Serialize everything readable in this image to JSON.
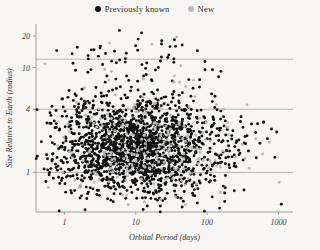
{
  "legend": {
    "items": [
      {
        "label": "Previously known",
        "color": "#111111",
        "icon": "filled-circle-icon"
      },
      {
        "label": "New",
        "color": "#b9b9b9",
        "icon": "filled-circle-icon"
      }
    ]
  },
  "chart_data": {
    "type": "scatter",
    "title": "",
    "xlabel": "Orbital Period (days)",
    "ylabel": "Size Relative to Earth (radius)",
    "xscale": "log",
    "yscale": "log",
    "xlim": [
      0.4,
      1600
    ],
    "ylim": [
      0.42,
      26
    ],
    "xticks": [
      1,
      10,
      100,
      1000
    ],
    "xticklabels": [
      "1",
      "10",
      "100",
      "1000"
    ],
    "yticks": [
      1,
      4,
      10,
      20
    ],
    "yticklabels": [
      "1",
      "4",
      "10",
      "20"
    ],
    "grid": "horizontal",
    "gridlines_y": [
      1,
      4,
      12
    ],
    "legend_position": "top-center",
    "background": "#f7f6f3",
    "series": [
      {
        "name": "Previously known",
        "color": "#111111",
        "marker": "circle",
        "marker_size": 2.0,
        "count": 1750,
        "density_note": "log-normal cloud centered near period 12 d, radius 1.6 Earth radii; heavy concentration between 0.9 and 3 Earth radii across 2-200 days"
      },
      {
        "name": "New",
        "color": "#b9b9b9",
        "marker": "circle",
        "marker_size": 2.0,
        "count": 250,
        "density_note": "sparser, similar cloud, proportionally more points at longer orbital periods (100-800 days) and smaller radii"
      }
    ],
    "points_known": [
      [
        0.52,
        1.08
      ],
      [
        0.55,
        0.82
      ],
      [
        0.58,
        1.35
      ],
      [
        0.61,
        0.95
      ],
      [
        0.64,
        2.2
      ],
      [
        0.68,
        1.5
      ],
      [
        0.7,
        0.88
      ],
      [
        0.72,
        3.1
      ],
      [
        0.75,
        1.2
      ],
      [
        0.78,
        14.5
      ],
      [
        0.8,
        1.05
      ],
      [
        0.83,
        0.9
      ],
      [
        0.86,
        2.6
      ],
      [
        0.9,
        1.3
      ],
      [
        0.93,
        1.75
      ],
      [
        0.96,
        1.0
      ],
      [
        1.0,
        1.4
      ],
      [
        1.02,
        0.78
      ],
      [
        1.05,
        2.0
      ],
      [
        1.1,
        1.25
      ],
      [
        1.12,
        5.2
      ],
      [
        1.15,
        1.6
      ],
      [
        1.2,
        1.05
      ],
      [
        1.22,
        0.92
      ],
      [
        1.25,
        2.4
      ],
      [
        1.3,
        1.45
      ],
      [
        1.32,
        11.0
      ],
      [
        1.35,
        1.1
      ],
      [
        1.4,
        1.85
      ],
      [
        1.45,
        1.3
      ],
      [
        1.5,
        0.95
      ],
      [
        1.52,
        3.4
      ],
      [
        1.55,
        1.6
      ],
      [
        1.6,
        1.15
      ],
      [
        1.65,
        2.1
      ],
      [
        1.7,
        1.4
      ],
      [
        1.72,
        0.85
      ],
      [
        1.75,
        1.9
      ],
      [
        1.8,
        1.25
      ],
      [
        1.85,
        4.3
      ],
      [
        1.9,
        1.55
      ],
      [
        1.95,
        1.0
      ],
      [
        2.0,
        1.7
      ],
      [
        2.05,
        2.3
      ],
      [
        2.1,
        1.2
      ],
      [
        2.15,
        13.0
      ],
      [
        2.2,
        1.45
      ],
      [
        2.25,
        0.9
      ],
      [
        2.3,
        2.8
      ],
      [
        2.4,
        1.6
      ],
      [
        2.45,
        1.15
      ],
      [
        2.5,
        1.95
      ],
      [
        2.55,
        1.35
      ],
      [
        2.6,
        3.6
      ],
      [
        2.7,
        1.5
      ],
      [
        2.75,
        1.05
      ],
      [
        2.8,
        2.2
      ],
      [
        2.9,
        1.7
      ],
      [
        2.95,
        1.25
      ],
      [
        3.0,
        1.9
      ],
      [
        3.1,
        1.4
      ],
      [
        3.2,
        16.0
      ],
      [
        3.25,
        1.6
      ],
      [
        3.3,
        1.1
      ],
      [
        3.4,
        2.5
      ],
      [
        3.5,
        1.8
      ],
      [
        3.55,
        1.3
      ],
      [
        3.6,
        2.05
      ],
      [
        3.7,
        1.5
      ],
      [
        3.8,
        1.15
      ],
      [
        3.9,
        2.9
      ],
      [
        4.0,
        1.65
      ],
      [
        4.1,
        1.35
      ],
      [
        4.2,
        2.15
      ],
      [
        4.3,
        1.05
      ],
      [
        4.4,
        1.85
      ],
      [
        4.5,
        1.45
      ],
      [
        4.6,
        11.5
      ],
      [
        4.7,
        2.4
      ],
      [
        4.8,
        1.6
      ],
      [
        4.9,
        1.2
      ],
      [
        5.0,
        1.95
      ],
      [
        5.2,
        1.4
      ],
      [
        5.4,
        2.6
      ],
      [
        5.5,
        1.7
      ],
      [
        5.6,
        1.1
      ],
      [
        5.8,
        2.1
      ],
      [
        6.0,
        1.5
      ],
      [
        6.2,
        1.8
      ],
      [
        6.4,
        1.3
      ],
      [
        6.5,
        3.2
      ],
      [
        6.8,
        1.65
      ],
      [
        7.0,
        2.2
      ],
      [
        7.2,
        1.45
      ],
      [
        7.5,
        1.9
      ],
      [
        7.8,
        1.25
      ],
      [
        8.0,
        2.45
      ],
      [
        8.2,
        1.6
      ],
      [
        8.5,
        1.35
      ],
      [
        8.8,
        2.0
      ],
      [
        9.0,
        1.75
      ],
      [
        9.3,
        1.15
      ],
      [
        9.6,
        2.7
      ],
      [
        10.0,
        1.55
      ],
      [
        10.4,
        1.95
      ],
      [
        10.8,
        1.3
      ],
      [
        11.0,
        2.25
      ],
      [
        11.5,
        1.7
      ],
      [
        12.0,
        1.45
      ],
      [
        12.5,
        2.1
      ],
      [
        13.0,
        1.85
      ],
      [
        13.5,
        1.2
      ],
      [
        14.0,
        2.55
      ],
      [
        14.5,
        1.6
      ],
      [
        15.0,
        1.4
      ],
      [
        15.5,
        2.0
      ],
      [
        16.0,
        1.75
      ],
      [
        17.0,
        1.3
      ],
      [
        18.0,
        2.3
      ],
      [
        19.0,
        1.55
      ],
      [
        20.0,
        1.9
      ],
      [
        21.0,
        1.45
      ],
      [
        22.0,
        2.15
      ],
      [
        23.0,
        1.7
      ],
      [
        25.0,
        1.25
      ],
      [
        27.0,
        2.4
      ],
      [
        29.0,
        1.6
      ],
      [
        31.0,
        1.95
      ],
      [
        33.0,
        1.4
      ],
      [
        35.0,
        2.2
      ],
      [
        38.0,
        1.8
      ],
      [
        41.0,
        1.5
      ],
      [
        44.0,
        2.6
      ],
      [
        48.0,
        1.65
      ],
      [
        52.0,
        2.0
      ],
      [
        56.0,
        1.35
      ],
      [
        60.0,
        2.3
      ],
      [
        65.0,
        1.75
      ],
      [
        70.0,
        1.55
      ],
      [
        78.0,
        2.45
      ],
      [
        85.0,
        1.9
      ],
      [
        92.0,
        1.4
      ],
      [
        100.0,
        2.1
      ],
      [
        110.0,
        1.7
      ],
      [
        120.0,
        2.8
      ],
      [
        130.0,
        1.5
      ],
      [
        145.0,
        2.25
      ],
      [
        160.0,
        1.95
      ],
      [
        180.0,
        3.1
      ],
      [
        200.0,
        1.8
      ],
      [
        230.0,
        2.5
      ],
      [
        260.0,
        2.0
      ],
      [
        300.0,
        3.4
      ],
      [
        340.0,
        2.2
      ],
      [
        380.0,
        1.6
      ],
      [
        420.0,
        2.9
      ],
      [
        480.0,
        2.4
      ],
      [
        550.0,
        1.9
      ],
      [
        620.0,
        3.0
      ],
      [
        700.0,
        2.1
      ],
      [
        800.0,
        2.6
      ]
    ],
    "points_new": [
      [
        0.6,
        0.72
      ],
      [
        0.95,
        1.0
      ],
      [
        1.4,
        0.85
      ],
      [
        2.1,
        1.2
      ],
      [
        2.8,
        0.95
      ],
      [
        3.6,
        1.55
      ],
      [
        4.5,
        1.1
      ],
      [
        5.5,
        0.9
      ],
      [
        6.8,
        1.35
      ],
      [
        8.5,
        1.05
      ],
      [
        10.5,
        1.6
      ],
      [
        13.0,
        1.15
      ],
      [
        16.0,
        0.95
      ],
      [
        20.0,
        1.45
      ],
      [
        25.0,
        1.25
      ],
      [
        31.0,
        1.8
      ],
      [
        38.0,
        1.1
      ],
      [
        47.0,
        1.5
      ],
      [
        58.0,
        0.98
      ],
      [
        72.0,
        1.7
      ],
      [
        88.0,
        1.3
      ],
      [
        110.0,
        2.0
      ],
      [
        135.0,
        1.15
      ],
      [
        165.0,
        1.6
      ],
      [
        200.0,
        2.3
      ],
      [
        250.0,
        1.4
      ],
      [
        310.0,
        1.85
      ],
      [
        390.0,
        1.1
      ],
      [
        480.0,
        2.1
      ],
      [
        600.0,
        1.5
      ],
      [
        750.0,
        1.95
      ]
    ]
  }
}
